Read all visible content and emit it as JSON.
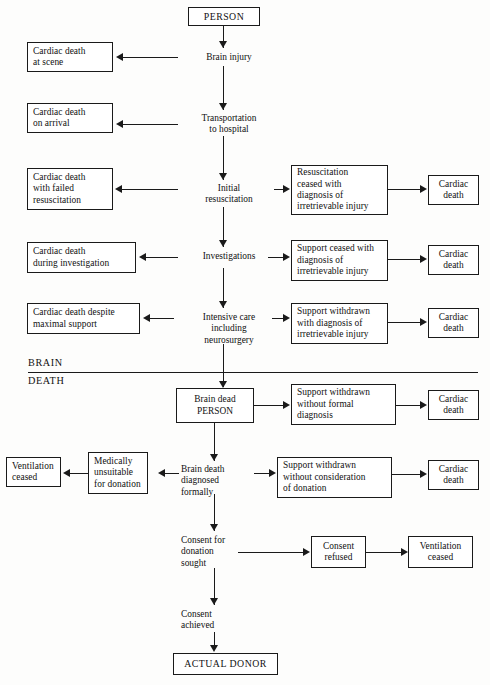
{
  "diagram": {
    "divider": {
      "upper_word": "BRAIN",
      "lower_word": "DEATH"
    },
    "nodes": {
      "person": "PERSON",
      "brain_injury": "Brain injury",
      "cardiac_death_at_scene": "Cardiac death\nat scene",
      "transportation": "Transportation\nto hospital",
      "cardiac_death_on_arrival": "Cardiac death\non arrival",
      "initial_resuscitation": "Initial\nresuscitation",
      "cardiac_death_failed_resus": "Cardiac death\nwith failed\nresuscitation",
      "resus_ceased": "Resuscitation\nceased with\ndiagnosis of\nirretrievable injury",
      "cardiac_death_1": "Cardiac\ndeath",
      "investigations": "Investigations",
      "cardiac_death_during_invest": "Cardiac death\nduring investigation",
      "support_ceased": "Support ceased with\ndiagnosis of\nirretrievable injury",
      "cardiac_death_2": "Cardiac\ndeath",
      "intensive_care": "Intensive care\nincluding\nneurosurgery",
      "cardiac_death_despite_max": "Cardiac death despite\nmaximal support",
      "support_withdrawn_diag": "Support withdrawn\nwith diagnosis of\nirretrievable injury",
      "cardiac_death_3": "Cardiac\ndeath",
      "brain_dead_person": "Brain dead\nPERSON",
      "support_withdrawn_no_formal": "Support withdrawn\nwithout formal\ndiagnosis",
      "cardiac_death_4": "Cardiac\ndeath",
      "brain_death_diagnosed": "Brain death\ndiagnosed\nformally",
      "medically_unsuitable": "Medically\nunsuitable\nfor donation",
      "ventilation_ceased_1": "Ventilation\nceased",
      "support_withdrawn_no_consid": "Support withdrawn\nwithout consideration\nof donation",
      "cardiac_death_5": "Cardiac\ndeath",
      "consent_sought": "Consent for\ndonation\nsought",
      "consent_refused": "Consent\nrefused",
      "ventilation_ceased_2": "Ventilation\nceased",
      "consent_achieved": "Consent\nachieved",
      "actual_donor": "ACTUAL DONOR"
    },
    "colors": {
      "stroke": "#1a1a1a",
      "text": "#111111",
      "background": "#fdfdfc"
    }
  }
}
